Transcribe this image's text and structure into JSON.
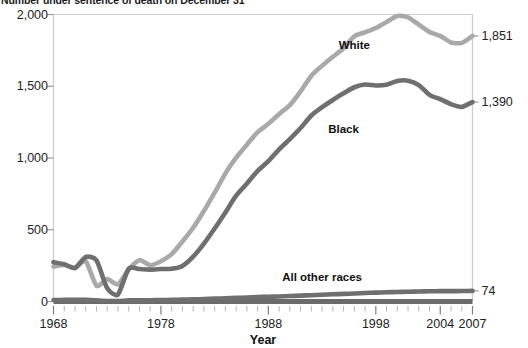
{
  "chart_data": {
    "type": "line",
    "title": "Number under sentence of death on December 31",
    "xlabel": "Year",
    "ylabel": "",
    "xlim": [
      1968,
      2007
    ],
    "ylim": [
      0,
      2000
    ],
    "grid": false,
    "legend_position": "inline-annotations",
    "y_ticks": [
      "0",
      "500",
      "1,000",
      "1,500",
      "2,000"
    ],
    "y_tick_values": [
      0,
      500,
      1000,
      1500,
      2000
    ],
    "x_ticks": [
      "1968",
      "1978",
      "1988",
      "1998",
      "2004",
      "2007"
    ],
    "x_tick_values": [
      1968,
      1978,
      1988,
      1998,
      2004,
      2007
    ],
    "x_minor_tick_step": 1,
    "x": [
      1968,
      1969,
      1970,
      1971,
      1972,
      1973,
      1974,
      1975,
      1976,
      1977,
      1978,
      1979,
      1980,
      1981,
      1982,
      1983,
      1984,
      1985,
      1986,
      1987,
      1988,
      1989,
      1990,
      1991,
      1992,
      1993,
      1994,
      1995,
      1996,
      1997,
      1998,
      1999,
      2000,
      2001,
      2002,
      2003,
      2004,
      2005,
      2006,
      2007
    ],
    "series": [
      {
        "name": "White",
        "color": "#a9a9a9",
        "label_x": 1996,
        "label_y": 1790,
        "end_value": 1851,
        "end_label": "1,851",
        "values": [
          243,
          254,
          236,
          281,
          110,
          156,
          120,
          224,
          288,
          253,
          281,
          330,
          418,
          514,
          631,
          758,
          893,
          1002,
          1093,
          1180,
          1238,
          1307,
          1368,
          1464,
          1573,
          1642,
          1705,
          1765,
          1848,
          1876,
          1906,
          1948,
          1990,
          1980,
          1929,
          1878,
          1851,
          1805,
          1802,
          1851
        ]
      },
      {
        "name": "Black",
        "color": "#6f6f6f",
        "label_x": 1995,
        "label_y": 1205,
        "end_value": 1390,
        "end_label": "1,390",
        "values": [
          274,
          259,
          233,
          310,
          287,
          92,
          49,
          229,
          226,
          222,
          226,
          228,
          248,
          313,
          404,
          509,
          621,
          737,
          822,
          910,
          978,
          1060,
          1132,
          1209,
          1296,
          1354,
          1404,
          1451,
          1493,
          1512,
          1505,
          1510,
          1537,
          1539,
          1508,
          1440,
          1410,
          1375,
          1356,
          1390
        ]
      },
      {
        "name": "All other races",
        "color": "#6f6f6f",
        "label_x": 1993,
        "label_y": 168,
        "end_value": 74,
        "end_label": "74",
        "values": [
          10,
          11,
          11,
          12,
          8,
          4,
          3,
          8,
          9,
          9,
          10,
          11,
          13,
          15,
          17,
          20,
          22,
          25,
          28,
          31,
          33,
          35,
          38,
          41,
          44,
          47,
          50,
          53,
          56,
          59,
          62,
          64,
          66,
          68,
          70,
          71,
          72,
          72,
          73,
          74
        ]
      }
    ]
  },
  "axis": {
    "x_title": "Year"
  }
}
